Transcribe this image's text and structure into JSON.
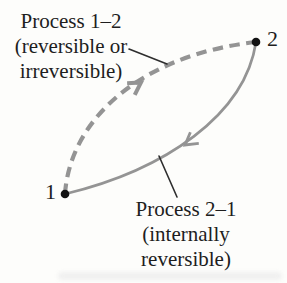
{
  "figure": {
    "colors": {
      "curve_gray": "#949494",
      "leader": "#2e2e2e",
      "dot": "#121212",
      "text": "#1e1e1e",
      "smudge": "#ededed"
    },
    "state_points": [
      {
        "label": "1"
      },
      {
        "label": "2"
      }
    ],
    "labels": {
      "process_1_2": {
        "line1": "Process 1–2",
        "line2": "(reversible or",
        "line3": "irreversible)"
      },
      "process_2_1": {
        "line1": "Process 2–1",
        "line2": "(internally",
        "line3": "reversible)"
      }
    },
    "curves": [
      {
        "name": "process-1-2",
        "style": "dashed",
        "from": "1",
        "to": "2",
        "path": "M 65 194 C 70 120 140 55 256 42"
      },
      {
        "name": "process-2-1",
        "style": "solid",
        "from": "2",
        "to": "1",
        "path": "M 256 42 C 245 115 165 170 65 194"
      }
    ]
  }
}
